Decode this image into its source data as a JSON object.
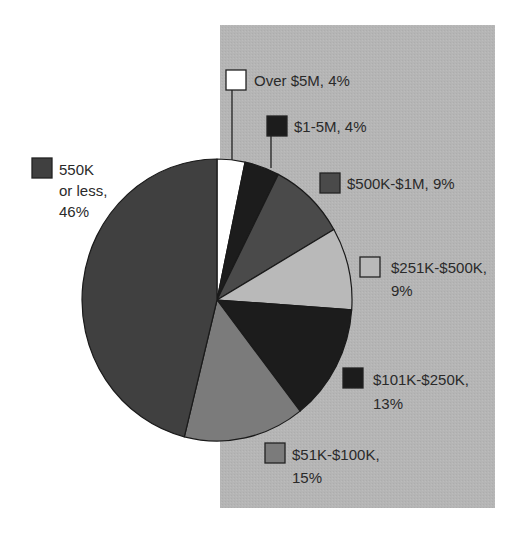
{
  "chart_data": {
    "type": "pie",
    "title": "",
    "start_angle_deg": 0,
    "direction": "clockwise",
    "slices": [
      {
        "label": "Over $5M",
        "value": 4,
        "display": "Over $5M, 4%",
        "color": "#ffffff",
        "draw_end_deg": 12
      },
      {
        "label": "$1-5M",
        "value": 4,
        "display": "$1-5M, 4%",
        "color": "#1c1c1c",
        "draw_end_deg": 27
      },
      {
        "label": "$500K-$1M",
        "value": 9,
        "display": "$500K-$1M, 9%",
        "color": "#4a4a4a",
        "draw_end_deg": 60
      },
      {
        "label": "$251K-$500K",
        "value": 9,
        "display": "$251K-$500K, 9%",
        "color": "#b9b9b9",
        "draw_end_deg": 94
      },
      {
        "label": "$101K-$250K",
        "value": 13,
        "display": "$101K-$250K, 13%",
        "color": "#1c1c1c",
        "draw_end_deg": 142
      },
      {
        "label": "$51K-$100K",
        "value": 15,
        "display": "$51K-$100K, 15%",
        "color": "#7b7b7b",
        "draw_end_deg": 194
      },
      {
        "label": "550K or less",
        "value": 46,
        "display": "550K or less, 46%",
        "color": "#404040",
        "draw_end_deg": 360
      }
    ],
    "legend_position": "callouts around pie",
    "background_panel_color": "#b5b5b5"
  },
  "labels": {
    "over5m": {
      "line1": "Over $5M, 4%"
    },
    "m1to5": {
      "line1": "$1-5M, 4%"
    },
    "k500to1m": {
      "line1": "$500K-$1M, 9%"
    },
    "k251to500": {
      "line1": "$251K-$500K,",
      "line2": "9%"
    },
    "k101to250": {
      "line1": "$101K-$250K,",
      "line2": "13%"
    },
    "k51to100": {
      "line1": "$51K-$100K,",
      "line2": "15%"
    },
    "k550less": {
      "line1": "550K",
      "line2": "or less,",
      "line3": "46%"
    }
  }
}
